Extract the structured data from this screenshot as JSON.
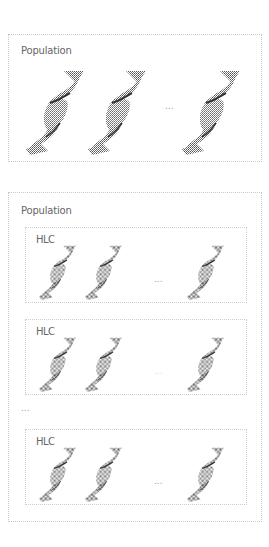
{
  "top_panel": {
    "title": "Population",
    "ellipsis": "...",
    "helix_count_shown": 3,
    "helix_icon": "dna-helix-icon"
  },
  "bottom_panel": {
    "title": "Population",
    "between_ellipsis": "...",
    "subgroups": [
      {
        "label": "HLC",
        "ellipsis": "...",
        "helix_count_shown": 3
      },
      {
        "label": "HLC",
        "ellipsis": "...",
        "helix_count_shown": 3
      },
      {
        "label": "HLC",
        "ellipsis": "...",
        "helix_count_shown": 3
      }
    ]
  },
  "colors": {
    "border": "#c8c8c8",
    "helix": "#555555",
    "text": "#666666"
  }
}
